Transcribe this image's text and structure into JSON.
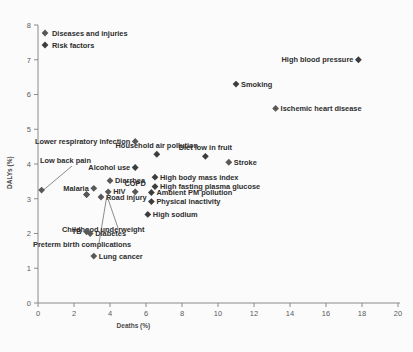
{
  "chart_data": {
    "type": "scatter",
    "title": "",
    "xlabel": "Deaths (%)",
    "ylabel": "DALYs (%)",
    "xlim": [
      0,
      20
    ],
    "ylim": [
      0,
      8
    ],
    "xticks": [
      0,
      2,
      4,
      6,
      8,
      10,
      12,
      14,
      16,
      18,
      20
    ],
    "yticks": [
      0,
      1,
      2,
      3,
      4,
      5,
      6,
      7,
      8
    ],
    "grid": false,
    "legend_position": "top-left",
    "legend": [
      {
        "name": "Diseases and injuries",
        "marker_fill": "#585858"
      },
      {
        "name": "Risk factors",
        "marker_fill": "#3d3d3d"
      }
    ],
    "points": [
      {
        "label": "High blood pressure",
        "x": 17.8,
        "y": 7.0,
        "series": "Risk factors",
        "label_pos": "left"
      },
      {
        "label": "Smoking",
        "x": 11.0,
        "y": 6.3,
        "series": "Risk factors",
        "label_pos": "right"
      },
      {
        "label": "Ischemic heart disease",
        "x": 13.2,
        "y": 5.6,
        "series": "Diseases and injuries",
        "label_pos": "right"
      },
      {
        "label": "Lower respiratory infection",
        "x": 5.4,
        "y": 4.65,
        "series": "Diseases and injuries",
        "label_pos": "left"
      },
      {
        "label": "Household air pollution",
        "x": 6.6,
        "y": 4.28,
        "series": "Risk factors",
        "label_pos": "above"
      },
      {
        "label": "Diet low in fruit",
        "x": 9.3,
        "y": 4.22,
        "series": "Risk factors",
        "label_pos": "above"
      },
      {
        "label": "Stroke",
        "x": 10.6,
        "y": 4.05,
        "series": "Diseases and injuries",
        "label_pos": "right"
      },
      {
        "label": "Alcohol use",
        "x": 5.4,
        "y": 3.9,
        "series": "Risk factors",
        "label_pos": "left"
      },
      {
        "label": "High body mass index",
        "x": 6.5,
        "y": 3.62,
        "series": "Risk factors",
        "label_pos": "right"
      },
      {
        "label": "Diarrhea",
        "x": 4.0,
        "y": 3.52,
        "series": "Diseases and injuries",
        "label_pos": "right"
      },
      {
        "label": "High fasting plasma glucose",
        "x": 6.5,
        "y": 3.35,
        "series": "Risk factors",
        "label_pos": "right"
      },
      {
        "label": "Low back pain",
        "x": 0.2,
        "y": 3.25,
        "series": "Diseases and injuries",
        "label_pos": "leader"
      },
      {
        "label": "Malaria",
        "x": 3.1,
        "y": 3.3,
        "series": "Diseases and injuries",
        "label_pos": "left"
      },
      {
        "label": "HIV",
        "x": 3.9,
        "y": 3.2,
        "series": "Diseases and injuries",
        "label_pos": "right"
      },
      {
        "label": "COPD",
        "x": 5.4,
        "y": 3.2,
        "series": "Diseases and injuries",
        "label_pos": "above"
      },
      {
        "label": "Ambient PM pollution",
        "x": 6.3,
        "y": 3.18,
        "series": "Risk factors",
        "label_pos": "right"
      },
      {
        "label": "Road injury",
        "x": 3.5,
        "y": 3.05,
        "series": "Diseases and injuries",
        "label_pos": "right"
      },
      {
        "label": "Physical inactivity",
        "x": 6.3,
        "y": 2.92,
        "series": "Risk factors",
        "label_pos": "right"
      },
      {
        "label": "Childhood underweight",
        "x": 2.7,
        "y": 3.12,
        "series": "Risk factors",
        "label_pos": "leader"
      },
      {
        "label": "Preterm birth complications",
        "x": 2.7,
        "y": 3.12,
        "series": "Diseases and injuries",
        "label_pos": "leader"
      },
      {
        "label": "High sodium",
        "x": 6.1,
        "y": 2.55,
        "series": "Risk factors",
        "label_pos": "right"
      },
      {
        "label": "Diabetes",
        "x": 2.9,
        "y": 2.0,
        "series": "Diseases and injuries",
        "label_pos": "right"
      },
      {
        "label": "TB",
        "x": 2.7,
        "y": 2.05,
        "series": "Diseases and injuries",
        "label_pos": "left"
      },
      {
        "label": "Lung cancer",
        "x": 3.1,
        "y": 1.35,
        "series": "Diseases and injuries",
        "label_pos": "right"
      }
    ]
  }
}
